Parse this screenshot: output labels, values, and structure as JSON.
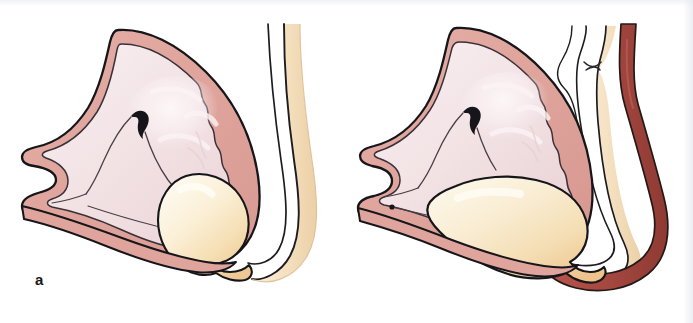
{
  "figure": {
    "kind": "medical-illustration",
    "panel_count": 2,
    "background_color": "#ffffff",
    "width": 693,
    "height": 323
  },
  "palette": {
    "outer_wall_fill": "#dfa49c",
    "outer_wall_fill_light": "#e6b3ab",
    "inner_mucosa_fill": "#f2e2e4",
    "inner_mucosa_highlight": "#faf2f3",
    "sac_fill_light": "#fdf6e4",
    "sac_fill_mid": "#f6e2bb",
    "sac_fill_deep": "#efc795",
    "duct_lumen_fill": "#ffffff",
    "duct_stripe_fill": "#f6e3c4",
    "vessel_red": "#a84a42",
    "vessel_red_dark": "#8e3a33",
    "outline_stroke": "#16161a",
    "thin_stroke": "#2a2a2e",
    "label_color": "#16161a"
  },
  "panels": [
    {
      "id": "a",
      "label": "a",
      "position": "left",
      "caption_state": "normal",
      "structures": [
        {
          "name": "outer-muscular-wall",
          "color": "#dfa49c"
        },
        {
          "name": "inner-mucosal-lining",
          "color": "#f2e2e4",
          "border": "scalloped"
        },
        {
          "name": "central-beak-marking",
          "color": "#16161a"
        },
        {
          "name": "small-sac",
          "color": "#f6e2bb",
          "size": "small-rounded"
        },
        {
          "name": "duct-loop",
          "color": "#ffffff",
          "stripe": "#f6e3c4"
        }
      ]
    },
    {
      "id": "b",
      "label": "b",
      "position": "right",
      "caption_state": "distended",
      "structures": [
        {
          "name": "outer-muscular-wall",
          "color": "#dfa49c"
        },
        {
          "name": "inner-mucosal-lining",
          "color": "#f2e2e4",
          "border": "scalloped"
        },
        {
          "name": "central-beak-marking",
          "color": "#16161a"
        },
        {
          "name": "enlarged-sac",
          "color": "#f6e2bb",
          "size": "large-teardrop"
        },
        {
          "name": "duct-loop",
          "color": "#ffffff",
          "stripe": "#f6e3c4",
          "feature": "constriction"
        },
        {
          "name": "blood-vessel",
          "color": "#a84a42"
        }
      ]
    }
  ]
}
